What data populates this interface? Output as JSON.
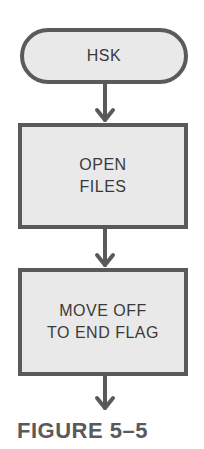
{
  "diagram": {
    "type": "flowchart",
    "nodes": [
      {
        "id": "start",
        "shape": "terminator",
        "label": "HSK"
      },
      {
        "id": "open",
        "shape": "process",
        "label": "OPEN\nFILES"
      },
      {
        "id": "move",
        "shape": "process",
        "label": "MOVE OFF\nTO END FLAG"
      }
    ],
    "edges": [
      {
        "from": "start",
        "to": "open"
      },
      {
        "from": "open",
        "to": "move"
      },
      {
        "from": "move",
        "to": "continuation"
      }
    ],
    "caption": "FIGURE 5–5",
    "colors": {
      "fill": "#e9e9e9",
      "stroke": "#5a5a5a",
      "text": "#3a3a3a"
    }
  }
}
